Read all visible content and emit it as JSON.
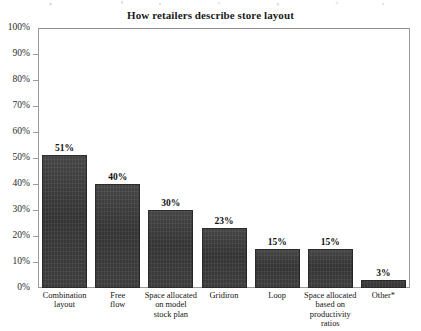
{
  "chart_data": {
    "type": "bar",
    "title": "How retailers describe store layout",
    "xlabel": "",
    "ylabel": "",
    "ylim": [
      0,
      100
    ],
    "grid": false,
    "legend": false,
    "y_ticks": [
      "100%",
      "90%",
      "80%",
      "70%",
      "60%",
      "50%",
      "40%",
      "30%",
      "20%",
      "10%",
      "0%"
    ],
    "y_tick_values": [
      100,
      90,
      80,
      70,
      60,
      50,
      40,
      30,
      20,
      10,
      0
    ],
    "categories": [
      "Combination layout",
      "Free flow",
      "Space allocated on model stock plan",
      "Gridiron",
      "Loop",
      "Space allocated based on productivity ratios",
      "Other*"
    ],
    "category_lines": [
      [
        "Combination",
        "layout"
      ],
      [
        "Free",
        "flow"
      ],
      [
        "Space allocated",
        "on model",
        "stock plan"
      ],
      [
        "Gridiron"
      ],
      [
        "Loop"
      ],
      [
        "Space allocated",
        "based on",
        "productivity",
        "ratios"
      ],
      [
        "Other*"
      ]
    ],
    "values": [
      51,
      40,
      30,
      23,
      15,
      15,
      3
    ],
    "value_labels": [
      "51%",
      "40%",
      "30%",
      "23%",
      "15%",
      "15%",
      "3%"
    ],
    "bar_color": "#3a3a3a",
    "axis_color": "#9a9a9a",
    "background": "#ffffff"
  }
}
